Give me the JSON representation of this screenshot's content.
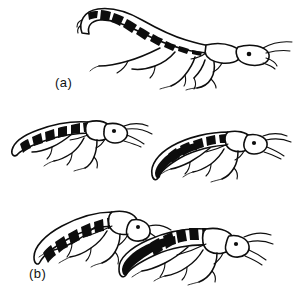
{
  "figure": {
    "background_color": "#ffffff",
    "ink_color": "#0d0d0d",
    "style": "black-and-white scientific line drawing",
    "panel_count": 3
  },
  "panels": [
    {
      "id": "a",
      "label": "(a)",
      "caption": "",
      "subject_count": 1,
      "description": "Single rove beetle standing on all legs with abdomen raised and curled forward over the thorax in a scorpion-like threat posture.",
      "subjects": [
        {
          "name": "beetle-a-1",
          "orientation": "facing right",
          "abdomen_posture": "raised and curled forward",
          "abdomen_bands": 9,
          "leg_count": 6,
          "antennae": 2,
          "eye": 1
        }
      ]
    },
    {
      "id": "b",
      "label": "(b)",
      "caption": "",
      "subject_count": 2,
      "description": "Two rove beetles shown separately in lowered postures; left beetle faces right with abdomen held horizontal, right beetle faces right with abdomen curved downward showing dark underside.",
      "subjects": [
        {
          "name": "beetle-b-left",
          "orientation": "facing right",
          "abdomen_posture": "held horizontal, slightly elevated",
          "abdomen_bands": 8,
          "leg_count": 6,
          "antennae": 2,
          "eye": 1
        },
        {
          "name": "beetle-b-right",
          "orientation": "facing right",
          "abdomen_posture": "curved downward, dark ventral surface visible",
          "abdomen_bands": 7,
          "leg_count": 6,
          "antennae": 2,
          "eye": 1
        }
      ]
    },
    {
      "id": "c",
      "label": "(c)",
      "caption": "",
      "subject_count": 2,
      "description": "Two rove beetles in contact, overlapping head to head; the rear-left individual's head meets the front-right individual's thorax in an interaction posture.",
      "subjects": [
        {
          "name": "beetle-c-left",
          "orientation": "facing right",
          "abdomen_posture": "elongate, held low and straight",
          "abdomen_bands": 8,
          "leg_count": 6,
          "antennae": 2,
          "eye": 1
        },
        {
          "name": "beetle-c-right",
          "orientation": "facing right",
          "abdomen_posture": "elongate, overlapping the left individual",
          "abdomen_bands": 9,
          "leg_count": 6,
          "antennae": 2,
          "eye": 1
        }
      ]
    }
  ]
}
